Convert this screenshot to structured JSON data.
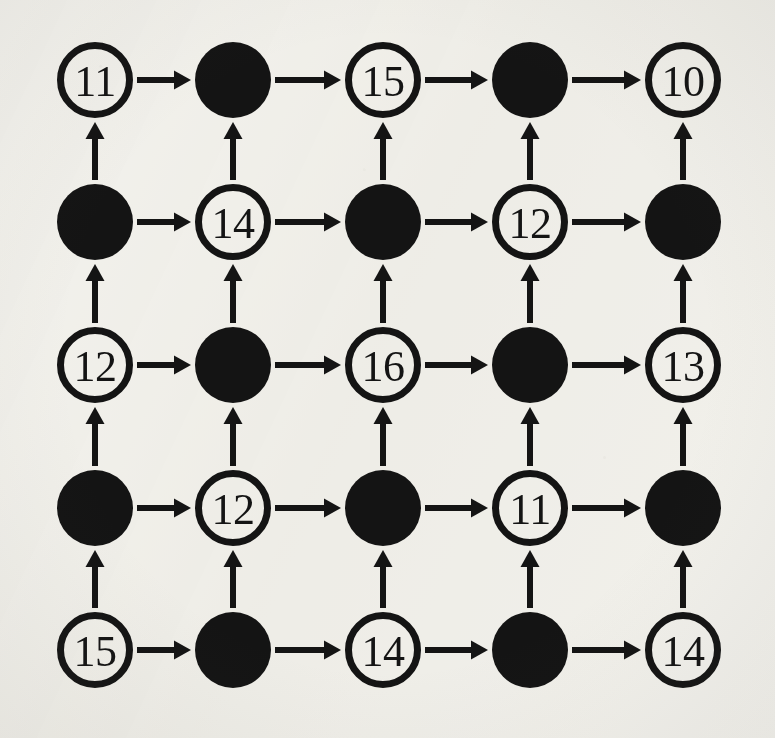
{
  "figure": {
    "kind": "lattice-digraph",
    "rows": 5,
    "cols": 5,
    "background_color": "#f2f1ec",
    "ink_color": "#141414",
    "node_radius": 38,
    "node_stroke_width": 7,
    "arrow_shaft_width": 6,
    "arrowhead_width": 19,
    "arrowhead_length": 17,
    "col_centers": [
      95,
      233,
      383,
      530,
      683
    ],
    "row_centers": [
      80,
      222,
      365,
      508,
      650
    ]
  },
  "legend": {
    "open_node_name": "open-circle-vertex",
    "filled_node_name": "filled-circle-vertex",
    "horizontal_edge_name": "rightward-arrow",
    "vertical_edge_name": "upward-arrow"
  },
  "chart_data": {
    "type": "diagram",
    "grid": {
      "rows": 5,
      "cols": 5,
      "pattern": "checkerboard",
      "open_when": "(row + col) even"
    },
    "nodes": [
      {
        "id": "r1c1",
        "row": 1,
        "col": 1,
        "filled": false,
        "label": "11",
        "cx": 95,
        "cy": 80
      },
      {
        "id": "r1c2",
        "row": 1,
        "col": 2,
        "filled": true,
        "label": "",
        "cx": 233,
        "cy": 80
      },
      {
        "id": "r1c3",
        "row": 1,
        "col": 3,
        "filled": false,
        "label": "15",
        "cx": 383,
        "cy": 80
      },
      {
        "id": "r1c4",
        "row": 1,
        "col": 4,
        "filled": true,
        "label": "",
        "cx": 530,
        "cy": 80
      },
      {
        "id": "r1c5",
        "row": 1,
        "col": 5,
        "filled": false,
        "label": "10",
        "cx": 683,
        "cy": 80
      },
      {
        "id": "r2c1",
        "row": 2,
        "col": 1,
        "filled": true,
        "label": "",
        "cx": 95,
        "cy": 222
      },
      {
        "id": "r2c2",
        "row": 2,
        "col": 2,
        "filled": false,
        "label": "14",
        "cx": 233,
        "cy": 222
      },
      {
        "id": "r2c3",
        "row": 2,
        "col": 3,
        "filled": true,
        "label": "",
        "cx": 383,
        "cy": 222
      },
      {
        "id": "r2c4",
        "row": 2,
        "col": 4,
        "filled": false,
        "label": "12",
        "cx": 530,
        "cy": 222
      },
      {
        "id": "r2c5",
        "row": 2,
        "col": 5,
        "filled": true,
        "label": "",
        "cx": 683,
        "cy": 222
      },
      {
        "id": "r3c1",
        "row": 3,
        "col": 1,
        "filled": false,
        "label": "12",
        "cx": 95,
        "cy": 365
      },
      {
        "id": "r3c2",
        "row": 3,
        "col": 2,
        "filled": true,
        "label": "",
        "cx": 233,
        "cy": 365
      },
      {
        "id": "r3c3",
        "row": 3,
        "col": 3,
        "filled": false,
        "label": "16",
        "cx": 383,
        "cy": 365
      },
      {
        "id": "r3c4",
        "row": 3,
        "col": 4,
        "filled": true,
        "label": "",
        "cx": 530,
        "cy": 365
      },
      {
        "id": "r3c5",
        "row": 3,
        "col": 5,
        "filled": false,
        "label": "13",
        "cx": 683,
        "cy": 365
      },
      {
        "id": "r4c1",
        "row": 4,
        "col": 1,
        "filled": true,
        "label": "",
        "cx": 95,
        "cy": 508
      },
      {
        "id": "r4c2",
        "row": 4,
        "col": 2,
        "filled": false,
        "label": "12",
        "cx": 233,
        "cy": 508
      },
      {
        "id": "r4c3",
        "row": 4,
        "col": 3,
        "filled": true,
        "label": "",
        "cx": 383,
        "cy": 508
      },
      {
        "id": "r4c4",
        "row": 4,
        "col": 4,
        "filled": false,
        "label": "11",
        "cx": 530,
        "cy": 508
      },
      {
        "id": "r4c5",
        "row": 4,
        "col": 5,
        "filled": true,
        "label": "",
        "cx": 683,
        "cy": 508
      },
      {
        "id": "r5c1",
        "row": 5,
        "col": 1,
        "filled": false,
        "label": "15",
        "cx": 95,
        "cy": 650
      },
      {
        "id": "r5c2",
        "row": 5,
        "col": 2,
        "filled": true,
        "label": "",
        "cx": 233,
        "cy": 650
      },
      {
        "id": "r5c3",
        "row": 5,
        "col": 3,
        "filled": false,
        "label": "14",
        "cx": 383,
        "cy": 650
      },
      {
        "id": "r5c4",
        "row": 5,
        "col": 4,
        "filled": true,
        "label": "",
        "cx": 530,
        "cy": 650
      },
      {
        "id": "r5c5",
        "row": 5,
        "col": 5,
        "filled": false,
        "label": "14",
        "cx": 683,
        "cy": 650
      }
    ],
    "edges_horizontal": [
      {
        "from": "r1c1",
        "to": "r1c2",
        "direction": "right"
      },
      {
        "from": "r1c2",
        "to": "r1c3",
        "direction": "right"
      },
      {
        "from": "r1c3",
        "to": "r1c4",
        "direction": "right"
      },
      {
        "from": "r1c4",
        "to": "r1c5",
        "direction": "right"
      },
      {
        "from": "r2c1",
        "to": "r2c2",
        "direction": "right"
      },
      {
        "from": "r2c2",
        "to": "r2c3",
        "direction": "right"
      },
      {
        "from": "r2c3",
        "to": "r2c4",
        "direction": "right"
      },
      {
        "from": "r2c4",
        "to": "r2c5",
        "direction": "right"
      },
      {
        "from": "r3c1",
        "to": "r3c2",
        "direction": "right"
      },
      {
        "from": "r3c2",
        "to": "r3c3",
        "direction": "right"
      },
      {
        "from": "r3c3",
        "to": "r3c4",
        "direction": "right"
      },
      {
        "from": "r3c4",
        "to": "r3c5",
        "direction": "right"
      },
      {
        "from": "r4c1",
        "to": "r4c2",
        "direction": "right"
      },
      {
        "from": "r4c2",
        "to": "r4c3",
        "direction": "right"
      },
      {
        "from": "r4c3",
        "to": "r4c4",
        "direction": "right"
      },
      {
        "from": "r4c4",
        "to": "r4c5",
        "direction": "right"
      },
      {
        "from": "r5c1",
        "to": "r5c2",
        "direction": "right"
      },
      {
        "from": "r5c2",
        "to": "r5c3",
        "direction": "right"
      },
      {
        "from": "r5c3",
        "to": "r5c4",
        "direction": "right"
      },
      {
        "from": "r5c4",
        "to": "r5c5",
        "direction": "right"
      }
    ],
    "edges_vertical": [
      {
        "from": "r2c1",
        "to": "r1c1",
        "direction": "up"
      },
      {
        "from": "r2c2",
        "to": "r1c2",
        "direction": "up"
      },
      {
        "from": "r2c3",
        "to": "r1c3",
        "direction": "up"
      },
      {
        "from": "r2c4",
        "to": "r1c4",
        "direction": "up"
      },
      {
        "from": "r2c5",
        "to": "r1c5",
        "direction": "up"
      },
      {
        "from": "r3c1",
        "to": "r2c1",
        "direction": "up"
      },
      {
        "from": "r3c2",
        "to": "r2c2",
        "direction": "up"
      },
      {
        "from": "r3c3",
        "to": "r2c3",
        "direction": "up"
      },
      {
        "from": "r3c4",
        "to": "r2c4",
        "direction": "up"
      },
      {
        "from": "r3c5",
        "to": "r2c5",
        "direction": "up"
      },
      {
        "from": "r4c1",
        "to": "r3c1",
        "direction": "up"
      },
      {
        "from": "r4c2",
        "to": "r3c2",
        "direction": "up"
      },
      {
        "from": "r4c3",
        "to": "r3c3",
        "direction": "up"
      },
      {
        "from": "r4c4",
        "to": "r3c4",
        "direction": "up"
      },
      {
        "from": "r4c5",
        "to": "r3c5",
        "direction": "up"
      },
      {
        "from": "r5c1",
        "to": "r4c1",
        "direction": "up"
      },
      {
        "from": "r5c2",
        "to": "r4c2",
        "direction": "up"
      },
      {
        "from": "r5c3",
        "to": "r4c3",
        "direction": "up"
      },
      {
        "from": "r5c4",
        "to": "r4c4",
        "direction": "up"
      },
      {
        "from": "r5c5",
        "to": "r4c5",
        "direction": "up"
      }
    ],
    "labels_by_row": [
      [
        "11",
        "",
        "15",
        "",
        "10"
      ],
      [
        "",
        "14",
        "",
        "12",
        ""
      ],
      [
        "12",
        "",
        "16",
        "",
        "13"
      ],
      [
        "",
        "12",
        "",
        "11",
        ""
      ],
      [
        "15",
        "",
        "14",
        "",
        "14"
      ]
    ]
  }
}
